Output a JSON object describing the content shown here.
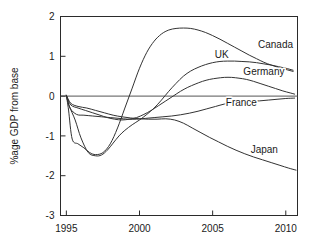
{
  "chart_data": {
    "type": "line",
    "title": "",
    "xlabel": "",
    "ylabel": "%age GDP from base",
    "xlim": [
      1994.6,
      2010.8
    ],
    "ylim": [
      -3,
      2
    ],
    "xticks": [
      1995,
      2000,
      2005,
      2010
    ],
    "xticklabels": [
      "1995",
      "2000",
      "2005",
      "2010"
    ],
    "yticks": [
      2,
      1,
      0,
      -1,
      -2,
      -3
    ],
    "yticklabels": [
      "2",
      "1",
      "0",
      "-1",
      "-2",
      "-3"
    ],
    "grid": false,
    "legend_position": "inline-right-labels",
    "zero_reference_line": 0,
    "series": [
      {
        "name": "Canada",
        "label": "Canada",
        "label_x": 2008.1,
        "label_y": 1.2,
        "x": [
          1995.0,
          1995.15,
          1995.4,
          1995.8,
          1996.2,
          1996.6,
          1997.0,
          1997.5,
          1998.0,
          1998.5,
          1999.0,
          1999.5,
          2000.0,
          2000.5,
          2001.0,
          2001.5,
          2002.0,
          2002.5,
          2003.0,
          2003.5,
          2004.0,
          2004.5,
          2005.0,
          2005.5,
          2006.0,
          2006.5,
          2007.0,
          2007.5,
          2008.0,
          2008.5,
          2009.0,
          2009.5,
          2010.0,
          2010.5
        ],
        "y": [
          0.02,
          -0.35,
          -1.08,
          -1.2,
          -1.3,
          -1.42,
          -1.47,
          -1.42,
          -1.2,
          -0.8,
          -0.3,
          0.2,
          0.7,
          1.1,
          1.38,
          1.56,
          1.66,
          1.7,
          1.71,
          1.7,
          1.66,
          1.6,
          1.52,
          1.43,
          1.33,
          1.23,
          1.13,
          1.03,
          0.94,
          0.85,
          0.78,
          0.72,
          0.67,
          0.62
        ]
      },
      {
        "name": "UK",
        "label": "UK",
        "label_x": 2005.15,
        "label_y": 0.95,
        "x": [
          1995.0,
          1995.2,
          1995.6,
          1996.0,
          1996.5,
          1997.0,
          1997.4,
          1997.8,
          1998.2,
          1998.6,
          1999.0,
          1999.5,
          2000.0,
          2000.5,
          2001.0,
          2001.5,
          2002.0,
          2002.5,
          2003.0,
          2003.5,
          2004.0,
          2004.5,
          2005.0,
          2005.5,
          2006.0,
          2006.5,
          2007.0,
          2007.5,
          2008.0,
          2008.5,
          2009.0,
          2009.5,
          2010.0,
          2010.5
        ],
        "y": [
          0.02,
          -0.25,
          -0.6,
          -1.05,
          -1.42,
          -1.5,
          -1.48,
          -1.36,
          -1.18,
          -1.0,
          -0.86,
          -0.72,
          -0.6,
          -0.46,
          -0.3,
          -0.1,
          0.12,
          0.32,
          0.5,
          0.63,
          0.72,
          0.79,
          0.84,
          0.87,
          0.88,
          0.88,
          0.87,
          0.86,
          0.84,
          0.81,
          0.78,
          0.74,
          0.7,
          0.65
        ]
      },
      {
        "name": "Germany",
        "label": "Germany",
        "label_x": 2007.1,
        "label_y": 0.54,
        "x": [
          1995.0,
          1995.3,
          1995.8,
          1996.3,
          1996.8,
          1997.3,
          1997.8,
          1998.3,
          1998.8,
          1999.3,
          1999.8,
          2000.3,
          2000.8,
          2001.3,
          2001.8,
          2002.3,
          2002.8,
          2003.3,
          2003.8,
          2004.3,
          2004.8,
          2005.3,
          2005.8,
          2006.3,
          2006.8,
          2007.3,
          2007.8,
          2008.3,
          2008.8,
          2009.3,
          2009.8,
          2010.3,
          2010.6
        ],
        "y": [
          0.02,
          -0.22,
          -0.3,
          -0.36,
          -0.42,
          -0.48,
          -0.54,
          -0.58,
          -0.6,
          -0.58,
          -0.54,
          -0.46,
          -0.36,
          -0.24,
          -0.12,
          0.0,
          0.12,
          0.22,
          0.3,
          0.37,
          0.42,
          0.45,
          0.47,
          0.47,
          0.45,
          0.42,
          0.37,
          0.31,
          0.25,
          0.19,
          0.13,
          0.08,
          0.05
        ]
      },
      {
        "name": "France",
        "label": "France",
        "label_x": 2005.9,
        "label_y": -0.26,
        "x": [
          1995.0,
          1995.25,
          1995.7,
          1996.2,
          1996.8,
          1997.4,
          1998.0,
          1998.6,
          1999.2,
          1999.8,
          2000.4,
          2001.0,
          2001.6,
          2002.2,
          2002.8,
          2003.4,
          2004.0,
          2004.6,
          2005.2,
          2005.8,
          2006.4,
          2007.0,
          2007.6,
          2008.2,
          2008.8,
          2009.4,
          2010.0,
          2010.6
        ],
        "y": [
          0.02,
          -0.3,
          -0.46,
          -0.48,
          -0.5,
          -0.52,
          -0.54,
          -0.56,
          -0.58,
          -0.58,
          -0.56,
          -0.54,
          -0.52,
          -0.5,
          -0.47,
          -0.43,
          -0.38,
          -0.32,
          -0.26,
          -0.2,
          -0.16,
          -0.14,
          -0.13,
          -0.12,
          -0.1,
          -0.08,
          -0.06,
          -0.05
        ]
      },
      {
        "name": "Japan",
        "label": "Japan",
        "label_x": 2007.6,
        "label_y": -1.42,
        "x": [
          1995.0,
          1995.3,
          1995.8,
          1996.4,
          1997.0,
          1997.6,
          1998.2,
          1998.8,
          1999.4,
          2000.0,
          2000.6,
          2001.2,
          2001.8,
          2002.4,
          2003.0,
          2003.6,
          2004.2,
          2004.8,
          2005.4,
          2006.0,
          2006.6,
          2007.2,
          2007.8,
          2008.4,
          2009.0,
          2009.6,
          2010.2,
          2010.7
        ],
        "y": [
          0.02,
          -0.18,
          -0.26,
          -0.3,
          -0.36,
          -0.42,
          -0.48,
          -0.52,
          -0.55,
          -0.57,
          -0.58,
          -0.58,
          -0.57,
          -0.6,
          -0.68,
          -0.8,
          -0.92,
          -1.04,
          -1.15,
          -1.26,
          -1.36,
          -1.45,
          -1.53,
          -1.6,
          -1.67,
          -1.74,
          -1.81,
          -1.86
        ]
      }
    ]
  }
}
